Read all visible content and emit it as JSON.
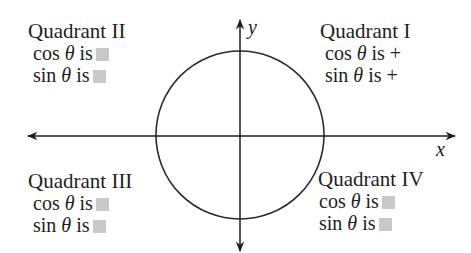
{
  "axes": {
    "x_label": "x",
    "y_label": "y"
  },
  "circle": {
    "cx": 240,
    "cy": 135,
    "r": 84,
    "stroke": "#2a2a2a"
  },
  "placeholder_color": "#c9c9c9",
  "quadrants": {
    "q1": {
      "title": "Quadrant I",
      "cos": "cos θ is",
      "cos_sign": "+",
      "sin": "sin  θ is",
      "sin_sign": "+"
    },
    "q2": {
      "title": "Quadrant II",
      "cos": "cos θ is",
      "cos_sign": "",
      "sin": "sin θ is",
      "sin_sign": ""
    },
    "q3": {
      "title": "Quadrant III",
      "cos": "cos θ is",
      "cos_sign": "",
      "sin": "sin θ is",
      "sin_sign": ""
    },
    "q4": {
      "title": "Quadrant IV",
      "cos": "cos θ is",
      "cos_sign": "",
      "sin": "sin θ is",
      "sin_sign": ""
    }
  }
}
